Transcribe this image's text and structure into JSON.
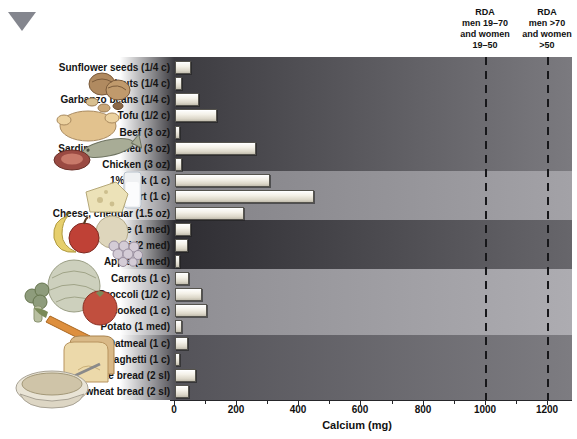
{
  "figure": {
    "triangle_marker_color": "#84868e"
  },
  "chart_data": {
    "type": "bar",
    "orientation": "horizontal",
    "xlabel": "Calcium (mg)",
    "xlim": [
      0,
      1280
    ],
    "xticks": [
      0,
      200,
      400,
      600,
      800,
      1000,
      1200
    ],
    "xticks_minor": [
      100,
      300,
      500,
      700,
      900,
      1100
    ],
    "grid": false,
    "items": [
      {
        "label": "Sunflower seeds (1/4 c)",
        "value": 45,
        "group": "nuts-seeds"
      },
      {
        "label": "Walnuts (1/4 c)",
        "value": 15,
        "group": "nuts-seeds"
      },
      {
        "label": "Garbanzo beans (1/4 c)",
        "value": 70,
        "group": "nuts-seeds"
      },
      {
        "label": "Tofu (1/2 c)",
        "value": 130,
        "group": "protein"
      },
      {
        "label": "Beef (3 oz)",
        "value": 10,
        "group": "protein"
      },
      {
        "label": "Sardines, canned (3 oz)",
        "value": 255,
        "group": "protein"
      },
      {
        "label": "Chicken (3 oz)",
        "value": 15,
        "group": "protein"
      },
      {
        "label": "1% Milk (1 c)",
        "value": 300,
        "group": "dairy"
      },
      {
        "label": "Yogurt (1 c)",
        "value": 440,
        "group": "dairy"
      },
      {
        "label": "Cheese, cheddar (1.5 oz)",
        "value": 215,
        "group": "dairy"
      },
      {
        "label": "Orange (1 med)",
        "value": 45,
        "group": "fruits"
      },
      {
        "label": "Kiwi (2 med)",
        "value": 35,
        "group": "fruits"
      },
      {
        "label": "Apple (1 med)",
        "value": 10,
        "group": "fruits"
      },
      {
        "label": "Carrots (1 c)",
        "value": 40,
        "group": "vegetables"
      },
      {
        "label": "Broccoli (1/2 c)",
        "value": 80,
        "group": "vegetables"
      },
      {
        "label": "Kale, cooked (1 c)",
        "value": 95,
        "group": "vegetables"
      },
      {
        "label": "Potato (1 med)",
        "value": 15,
        "group": "vegetables"
      },
      {
        "label": "Oatmeal (1 c)",
        "value": 35,
        "group": "grains"
      },
      {
        "label": "Spaghetti (1 c)",
        "value": 10,
        "group": "grains"
      },
      {
        "label": "White bread (2 sl)",
        "value": 60,
        "group": "grains"
      },
      {
        "label": "Whole-wheat bread (2 sl)",
        "value": 40,
        "group": "grains"
      }
    ],
    "bands": [
      {
        "group": "nuts-and-protein",
        "rows": 7,
        "color_left": "#3c3b40",
        "color_right": "#7b7a7f"
      },
      {
        "group": "dairy",
        "rows": 3,
        "color_left": "#838287",
        "color_right": "#a3a2a7"
      },
      {
        "group": "fruits",
        "rows": 3,
        "color_left": "#2e2d32",
        "color_right": "#67666b"
      },
      {
        "group": "vegetables",
        "rows": 4,
        "color_left": "#8f8e93",
        "color_right": "#adacb1"
      },
      {
        "group": "grains",
        "rows": 4,
        "color_left": "#545359",
        "color_right": "#7d7c81"
      }
    ],
    "rda_lines": [
      {
        "value": 1000,
        "label_lines": [
          "RDA",
          "men 19–70",
          "and women",
          "19–50"
        ]
      },
      {
        "value": 1200,
        "label_lines": [
          "RDA",
          "men >70",
          "and women",
          ">50"
        ]
      }
    ],
    "bar_color": "#ece8db",
    "dashed_line_color": "#17171a"
  }
}
